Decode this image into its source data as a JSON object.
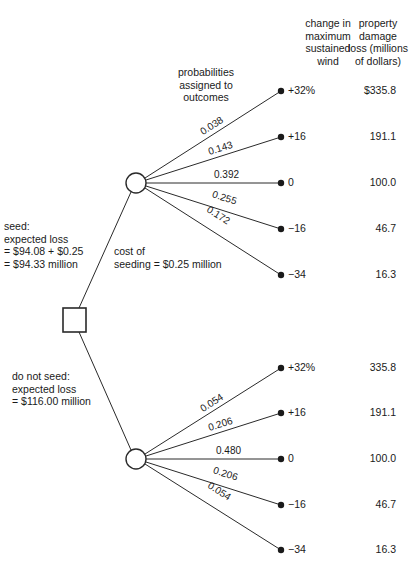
{
  "headers": {
    "wind_change": [
      "change in",
      "maximum",
      "sustained",
      "wind"
    ],
    "damage": [
      "property",
      "damage",
      "loss (millions",
      "of dollars)"
    ],
    "probabilities_note": [
      "probabilities",
      "assigned to",
      "outcomes"
    ]
  },
  "decision_node": {
    "label": "decision"
  },
  "seed_branch": {
    "label_lines": [
      "seed:",
      "expected loss",
      "= $94.08 + $0.25",
      "= $94.33 million"
    ],
    "cost_lines": [
      "cost of",
      "seeding = $0.25 million"
    ],
    "outcomes": [
      {
        "probability": "0.038",
        "wind": "+32%",
        "loss": "$335.8"
      },
      {
        "probability": "0.143",
        "wind": "+16",
        "loss": "191.1"
      },
      {
        "probability": "0.392",
        "wind": "0",
        "loss": "100.0"
      },
      {
        "probability": "0.255",
        "wind": "−16",
        "loss": "46.7"
      },
      {
        "probability": "0.172",
        "wind": "−34",
        "loss": "16.3"
      }
    ]
  },
  "no_seed_branch": {
    "label_lines": [
      "do not seed:",
      "expected loss",
      "= $116.00 million"
    ],
    "outcomes": [
      {
        "probability": "0.054",
        "wind": "+32%",
        "loss": "335.8"
      },
      {
        "probability": "0.206",
        "wind": "+16",
        "loss": "191.1"
      },
      {
        "probability": "0.480",
        "wind": "0",
        "loss": "100.0"
      },
      {
        "probability": "0.206",
        "wind": "−16",
        "loss": "46.7"
      },
      {
        "probability": "0.054",
        "wind": "−34",
        "loss": "16.3"
      }
    ]
  },
  "colors": {
    "line": "#2a2a2a",
    "text": "#1a1a1a",
    "background": "#ffffff"
  }
}
